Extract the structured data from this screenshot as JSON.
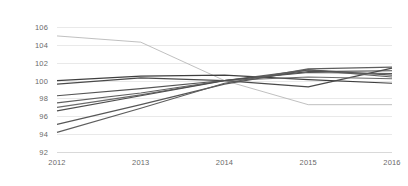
{
  "chart_data": {
    "type": "line",
    "title": "",
    "subtitle": "",
    "xlabel": "",
    "ylabel": "",
    "categories": [
      "2012",
      "2013",
      "2014",
      "2015",
      "2016"
    ],
    "x": [
      2012,
      2013,
      2014,
      2015,
      2016
    ],
    "ylim": [
      92,
      106
    ],
    "yticks": [
      92,
      94,
      96,
      98,
      100,
      102,
      104,
      106
    ],
    "ytick_labels": [
      "92",
      "94",
      "96",
      "98",
      "100",
      "102",
      "104",
      "106"
    ],
    "grid": true,
    "grid_axis": "y",
    "legend": false,
    "legend_position": "none",
    "annotations": [],
    "series": [
      {
        "name": "Series 1",
        "color": "#b0b0b0",
        "width": 0.8,
        "values": [
          105.0,
          104.3,
          100.0,
          97.3,
          97.3
        ]
      },
      {
        "name": "Series 2",
        "color": "#3f3f3f",
        "width": 1.2,
        "values": [
          100.0,
          100.5,
          100.6,
          100.1,
          99.7
        ]
      },
      {
        "name": "Series 3",
        "color": "#4a4a4a",
        "width": 1.2,
        "values": [
          99.6,
          100.3,
          100.0,
          99.3,
          101.4
        ]
      },
      {
        "name": "Series 4",
        "color": "#555555",
        "width": 1.1,
        "values": [
          98.3,
          99.1,
          100.0,
          100.9,
          100.8
        ]
      },
      {
        "name": "Series 5",
        "color": "#606060",
        "width": 1.1,
        "values": [
          97.5,
          98.6,
          100.0,
          101.2,
          100.4
        ]
      },
      {
        "name": "Series 6",
        "color": "#6b6b6b",
        "width": 1.1,
        "values": [
          97.0,
          98.4,
          100.0,
          100.4,
          100.2
        ]
      },
      {
        "name": "Series 7",
        "color": "#4f4f4f",
        "width": 1.2,
        "values": [
          96.6,
          98.3,
          100.0,
          101.0,
          101.1
        ]
      },
      {
        "name": "Series 8",
        "color": "#575757",
        "width": 1.2,
        "values": [
          95.1,
          97.3,
          99.6,
          101.2,
          100.6
        ]
      },
      {
        "name": "Series 9",
        "color": "#5e5e5e",
        "width": 1.2,
        "values": [
          94.2,
          96.9,
          99.7,
          101.3,
          101.5
        ]
      }
    ]
  }
}
